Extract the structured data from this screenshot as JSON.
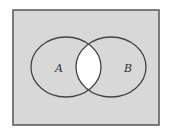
{
  "diagram": {
    "type": "venn",
    "universe": {
      "x": 13,
      "y": 10,
      "width": 146,
      "height": 115,
      "fill": "#d8d8d8",
      "stroke": "#555555"
    },
    "sets": [
      {
        "label": "A",
        "cx": 66,
        "cy": 67,
        "rx": 35,
        "ry": 30,
        "label_x": 55,
        "label_y": 72
      },
      {
        "label": "B",
        "cx": 111,
        "cy": 67,
        "rx": 35,
        "ry": 30,
        "label_x": 127,
        "label_y": 72
      }
    ],
    "shaded_region": "complement of A ∩ B",
    "unshaded_region": "A ∩ B",
    "colors": {
      "shaded": "#d8d8d8",
      "unshaded": "#ffffff",
      "outline": "#444444"
    }
  }
}
